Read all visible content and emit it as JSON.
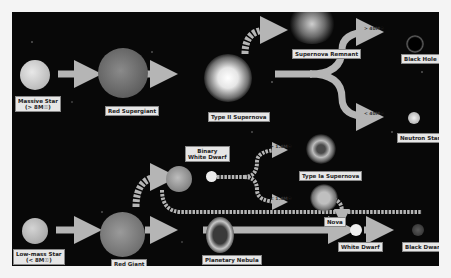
{
  "diagram": {
    "colors": {
      "background": "#080808",
      "arrow": "#b5b5b5",
      "label_bg": "#e6e6e6",
      "label_text": "#222222"
    },
    "nodes": {
      "massive_star": {
        "name": "Massive Star",
        "mass": "(> 8M☉)"
      },
      "red_supergiant": {
        "name": "Red Supergiant"
      },
      "type_ii_supernova": {
        "name": "Type II Supernova"
      },
      "supernova_remnant": {
        "name": "Supernova Remnant"
      },
      "black_hole": {
        "name": "Black Hole"
      },
      "neutron_star": {
        "name": "Neutron Star"
      },
      "binary_white_dwarf": {
        "name": "Binary",
        "name2": "White Dwarf"
      },
      "type_ia_supernova": {
        "name": "Type Ia Supernova"
      },
      "nova": {
        "name": "Nova"
      },
      "low_mass_star": {
        "name": "Low-mass Star",
        "mass": "(< 8M☉)"
      },
      "red_giant": {
        "name": "Red Giant"
      },
      "planetary_nebula": {
        "name": "Planetary Nebula"
      },
      "white_dwarf": {
        "name": "White Dwarf"
      },
      "black_dwarf": {
        "name": "Black Dwarf"
      }
    },
    "edge_labels": {
      "above_40": "> 40M☉",
      "below_40": "< 40M☉",
      "above_14": "> 1.4M☉",
      "below_14": "< 1.4M☉"
    }
  }
}
